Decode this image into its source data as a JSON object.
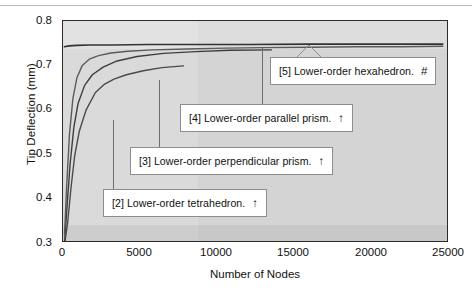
{
  "figure": {
    "background_color": "#ffffff",
    "plot_background_color": "#d4d4d4",
    "axis_color": "#2b2b2b"
  },
  "chart_data": {
    "type": "line",
    "title": "",
    "xlabel": "Number of Nodes",
    "ylabel": "Tip Deflection (mm)",
    "xlim": [
      0,
      25000
    ],
    "ylim": [
      0.3,
      0.8
    ],
    "xticks": [
      0,
      5000,
      10000,
      15000,
      20000,
      25000
    ],
    "xticklabels": [
      "0",
      "5000",
      "10000",
      "15000",
      "20000",
      "25000"
    ],
    "yticks": [
      0.3,
      0.4,
      0.5,
      0.6,
      0.7,
      0.8
    ],
    "yticklabels": [
      "0.3",
      "0.4",
      "0.5",
      "0.6",
      "0.7",
      "0.8"
    ],
    "grid": false,
    "legend": "annotations",
    "series": [
      {
        "name": "[2] Lower-order tetrahedron.",
        "index": 2,
        "marker": "↑",
        "color": "#4a4a4a",
        "x": [
          120,
          300,
          520,
          760,
          1050,
          1500,
          2100,
          2700,
          3300,
          4100,
          5200,
          6400,
          7800
        ],
        "y": [
          0.302,
          0.345,
          0.425,
          0.497,
          0.551,
          0.6,
          0.639,
          0.658,
          0.669,
          0.679,
          0.688,
          0.695,
          0.699
        ]
      },
      {
        "name": "[3] Lower-order perpendicular prism.",
        "index": 3,
        "marker": "↑",
        "color": "#3d3d3d",
        "x": [
          110,
          260,
          460,
          700,
          980,
          1400,
          1900,
          2600,
          3500,
          4800,
          6500,
          8600,
          10800,
          13500
        ],
        "y": [
          0.305,
          0.382,
          0.478,
          0.56,
          0.615,
          0.655,
          0.679,
          0.696,
          0.71,
          0.72,
          0.727,
          0.731,
          0.734,
          0.735
        ]
      },
      {
        "name": "[4] Lower-order parallel prism.",
        "index": 4,
        "marker": "↑",
        "color": "#5a5a5a",
        "x": [
          100,
          240,
          420,
          640,
          900,
          1250,
          1700,
          2300,
          3100,
          4200,
          5800,
          8000,
          10500,
          13000,
          16000,
          19000,
          22000,
          24600
        ],
        "y": [
          0.32,
          0.43,
          0.545,
          0.625,
          0.672,
          0.7,
          0.714,
          0.722,
          0.728,
          0.732,
          0.735,
          0.737,
          0.739,
          0.74,
          0.741,
          0.742,
          0.742,
          0.743
        ]
      },
      {
        "name": "[5] Lower-order hexahedron.",
        "index": 5,
        "marker": "#",
        "color": "#333333",
        "x": [
          90,
          400,
          900,
          1800,
          3200,
          5500,
          8500,
          12000,
          16000,
          20000,
          24600
        ],
        "y": [
          0.742,
          0.744,
          0.745,
          0.746,
          0.746,
          0.747,
          0.747,
          0.747,
          0.748,
          0.748,
          0.748
        ]
      }
    ]
  },
  "annotations": [
    {
      "id": "callout-2",
      "label": "[2] Lower-order tetrahedron.",
      "marker": "↑",
      "points_to_x": 3300,
      "points_to_y": 0.669
    },
    {
      "id": "callout-3",
      "label": "[3] Lower-order perpendicular prism.",
      "marker": "↑",
      "points_to_x": 6400,
      "points_to_y": 0.727
    },
    {
      "id": "callout-4",
      "label": "[4] Lower-order parallel prism.",
      "marker": "↑",
      "points_to_x": 13000,
      "points_to_y": 0.74
    },
    {
      "id": "callout-5",
      "label": "[5] Lower-order hexahedron.",
      "marker": "#",
      "points_to_x": 18500,
      "points_to_y": 0.748
    }
  ]
}
